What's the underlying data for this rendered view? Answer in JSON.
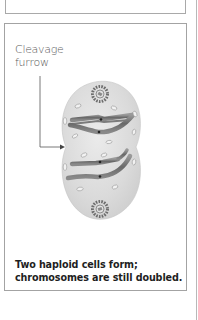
{
  "figure": {
    "label": {
      "line1": "Cleavage",
      "line2": "furrow"
    },
    "caption": {
      "line1": "Two haploid cells form;",
      "line2": "chromosomes are still doubled."
    },
    "icons": {
      "arrow": "arrow-right-icon",
      "centrosome": "centrosome-icon"
    },
    "colors": {
      "cell_fill": "#d9d9d9",
      "chromosome": "#6e6e6e",
      "border": "#a3a3a3",
      "label_text": "#5a5a5a",
      "caption_text": "#1e1e1e"
    }
  }
}
